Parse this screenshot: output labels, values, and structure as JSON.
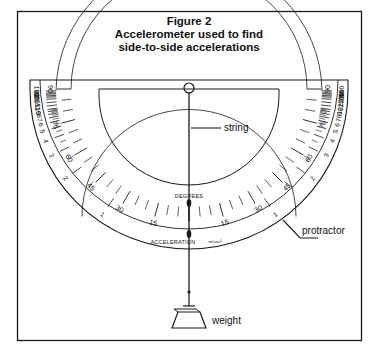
{
  "figure": {
    "border_color": "#1a1a1a",
    "ink_color": "#1a1a1a",
    "title_lines": [
      "Figure 2",
      "Accelerometer used to find",
      "side-to-side accelerations"
    ]
  },
  "labels": {
    "degrees": "DEGREES",
    "acceleration": "ACCELERATION",
    "acceleration_unit": "m/sec²",
    "string": "string",
    "weight": "weight",
    "protractor": "protractor"
  },
  "scales": {
    "degrees": {
      "name": "DEGREES",
      "major_labels": [
        15,
        30,
        45,
        60,
        75,
        90
      ],
      "minor_step_deg": 5,
      "range_deg": [
        0,
        90
      ],
      "sides": [
        "left",
        "right"
      ]
    },
    "acceleration": {
      "name": "ACCELERATION",
      "unit": "m/sec²",
      "labels": [
        1,
        2,
        3,
        4,
        5,
        6,
        7,
        8,
        9,
        10,
        12,
        15,
        20,
        25,
        30,
        40,
        50,
        100
      ],
      "sides": [
        "left",
        "right"
      ]
    }
  },
  "parts": [
    {
      "id": "pivot",
      "name": "pivot-eyelet"
    },
    {
      "id": "string",
      "name": "plumb-string"
    },
    {
      "id": "weight",
      "name": "plumb-weight"
    },
    {
      "id": "protractor",
      "name": "protractor-body"
    }
  ]
}
